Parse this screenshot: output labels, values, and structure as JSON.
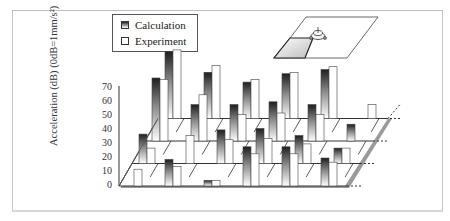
{
  "legend": {
    "calculation": "Calculation",
    "experiment": "Experiment"
  },
  "axis": {
    "ytitle": "Acceleration (dB) (0dB=1mm/s²)",
    "ticks": [
      "0",
      "10",
      "20",
      "30",
      "40",
      "50",
      "60",
      "70"
    ]
  },
  "colors": {
    "calc_dark": "#1e1e1e",
    "calc_light": "#ffffff",
    "exp": "#ffffff",
    "floor_shadow": "#9a9a9a",
    "frame": "#c4c4c4"
  },
  "chart_data": {
    "type": "bar",
    "subtype": "3d-grouped-bar",
    "title": "",
    "xlabel": "",
    "ylabel": "Acceleration (dB) (0dB=1mm/s²)",
    "ylim": [
      0,
      70
    ],
    "yticks": [
      0,
      10,
      20,
      30,
      40,
      50,
      60,
      70
    ],
    "legend": [
      "Calculation",
      "Experiment"
    ],
    "legend_position": "top-left",
    "inset_diagram": "floor slab with machine (excitation source) on plane",
    "rows": [
      {
        "row": 1,
        "position": "front",
        "pairs": [
          {
            "calculation": 0,
            "experiment": 12
          },
          {
            "calculation": 19,
            "experiment": 14
          },
          {
            "calculation": 4,
            "experiment": 4
          },
          {
            "calculation": 28,
            "experiment": 23
          },
          {
            "calculation": 28,
            "experiment": 23
          },
          {
            "calculation": 20,
            "experiment": 17
          }
        ]
      },
      {
        "row": 2,
        "pairs": [
          {
            "calculation": 21,
            "experiment": 11
          },
          {
            "calculation": 0,
            "experiment": 20
          },
          {
            "calculation": 24,
            "experiment": 17
          },
          {
            "calculation": 25,
            "experiment": 18
          },
          {
            "calculation": 20,
            "experiment": 14
          },
          {
            "calculation": 11,
            "experiment": 11
          }
        ]
      },
      {
        "row": 3,
        "pairs": [
          {
            "calculation": 45,
            "experiment": 44
          },
          {
            "calculation": 26,
            "experiment": 33
          },
          {
            "calculation": 26,
            "experiment": 19
          },
          {
            "calculation": 28,
            "experiment": 20
          },
          {
            "calculation": 26,
            "experiment": 19
          },
          {
            "calculation": 12,
            "experiment": 0
          }
        ]
      },
      {
        "row": 4,
        "position": "back",
        "pairs": [
          {
            "calculation": 48,
            "experiment": 49
          },
          {
            "calculation": 33,
            "experiment": 38
          },
          {
            "calculation": 26,
            "experiment": 28
          },
          {
            "calculation": 32,
            "experiment": 33
          },
          {
            "calculation": 35,
            "experiment": 37
          },
          {
            "calculation": 0,
            "experiment": 10
          }
        ]
      }
    ]
  }
}
